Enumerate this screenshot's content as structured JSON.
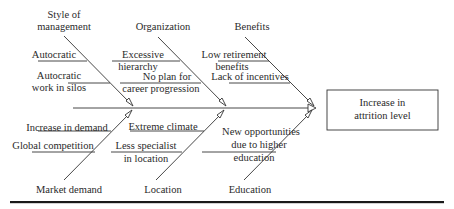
{
  "diagram": {
    "type": "fishbone",
    "effect": {
      "line1": "Increase in",
      "line2": "attrition level",
      "full": "Increase in attrition level"
    },
    "categories": {
      "style_of_management": {
        "line1": "Style of",
        "line2": "management",
        "causes": {
          "c1": "Autocratic",
          "c2_line1": "Autocratic",
          "c2_line2": "work in silos"
        }
      },
      "organization": {
        "label": "Organization",
        "causes": {
          "c1_line1": "Excessive",
          "c1_line2": "hierarchy",
          "c2_line1": "No plan for",
          "c2_line2": "career progression"
        }
      },
      "benefits": {
        "label": "Benefits",
        "causes": {
          "c1_line1": "Low retirement",
          "c1_line2": "benefits",
          "c2": "Lack of incentives"
        }
      },
      "market_demand": {
        "label": "Market demand",
        "causes": {
          "c1": "Increase in demand",
          "c2": "Global competition"
        }
      },
      "location": {
        "label": "Location",
        "causes": {
          "c1": "Extreme climate",
          "c2_line1": "Less specialist",
          "c2_line2": "in location"
        }
      },
      "education": {
        "label": "Education",
        "causes": {
          "c1_line1": "New opportunities",
          "c1_line2": "due to higher",
          "c1_line3": "education"
        }
      }
    },
    "colors": {
      "line": "#333333",
      "text": "#2a2a2a",
      "background": "#ffffff"
    }
  }
}
